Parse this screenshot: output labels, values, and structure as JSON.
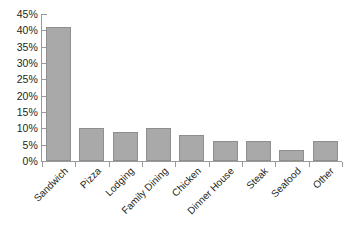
{
  "chart_data": {
    "type": "bar",
    "title": "",
    "xlabel": "",
    "ylabel": "",
    "categories": [
      "Sandwich",
      "Pizza",
      "Lodging",
      "Family Dining",
      "Chicken",
      "Dinner House",
      "Steak",
      "Seafood",
      "Other"
    ],
    "values": [
      41,
      10,
      9,
      10,
      8,
      6,
      6,
      3.5,
      6
    ],
    "value_suffix": "%",
    "ylim": [
      0,
      45
    ],
    "ytick_values": [
      0,
      5,
      10,
      15,
      20,
      25,
      30,
      35,
      40,
      45
    ],
    "ytick_labels": [
      "0%",
      "5%",
      "10%",
      "15%",
      "20%",
      "25%",
      "30%",
      "35%",
      "40%",
      "45%"
    ],
    "grid": false,
    "legend": null,
    "legend_position": "none",
    "xtick_label_rotation": -45,
    "colors": {
      "bar_fill": "#a9a9a9",
      "bar_border": "#8e8e8e",
      "axis": "#9a9a9a",
      "text": "#231f20",
      "background": "#ffffff"
    }
  }
}
